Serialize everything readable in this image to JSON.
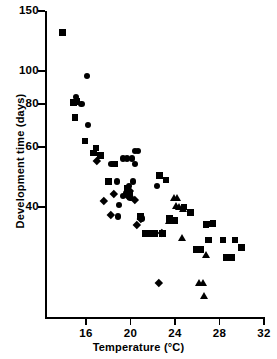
{
  "chart_data": {
    "type": "scatter",
    "title": "",
    "xlabel": "Temperature (°C)",
    "ylabel": "Development time (days)",
    "xlim": [
      13,
      32
    ],
    "ylim": [
      18,
      150
    ],
    "yscale": "log",
    "xscale": "linear",
    "grid": false,
    "legend": "none",
    "x_ticks": [
      16,
      20,
      24,
      28,
      32
    ],
    "x_tick_labels": [
      "16",
      "20",
      "24",
      "28",
      "32"
    ],
    "y_ticks": [
      150,
      100,
      80,
      60,
      40
    ],
    "y_tick_labels": [
      "150",
      "100",
      "80",
      "60",
      "40"
    ],
    "series": [
      {
        "name": "square",
        "marker": "square",
        "points": [
          [
            13.9,
            130
          ],
          [
            14.9,
            81
          ],
          [
            15.2,
            81.5
          ],
          [
            15.0,
            73
          ],
          [
            15.9,
            62.5
          ],
          [
            16.7,
            57.5
          ],
          [
            16.9,
            59.5
          ],
          [
            17.3,
            56.5
          ],
          [
            18.0,
            47.5
          ],
          [
            18.6,
            53.5
          ],
          [
            19.7,
            45.5
          ],
          [
            19.9,
            44.0
          ],
          [
            20.9,
            37.5
          ],
          [
            21.3,
            33.5
          ],
          [
            21.6,
            33.5
          ],
          [
            21.9,
            33.5
          ],
          [
            22.2,
            33.5
          ],
          [
            22.6,
            49.5
          ],
          [
            23.2,
            48.0
          ],
          [
            23.5,
            37.0
          ],
          [
            24.0,
            36.5
          ],
          [
            25.4,
            38.5
          ],
          [
            25.9,
            30.0
          ],
          [
            26.3,
            30.0
          ],
          [
            26.8,
            35.5
          ],
          [
            27.2,
            35.7
          ],
          [
            27.4,
            35.8
          ],
          [
            27.0,
            32.0
          ],
          [
            28.3,
            32.0
          ],
          [
            28.6,
            28.5
          ],
          [
            29.1,
            28.5
          ],
          [
            29.4,
            32.0
          ],
          [
            30.0,
            30.5
          ],
          [
            24.8,
            40.0
          ],
          [
            22.9,
            33.5
          ]
        ]
      },
      {
        "name": "circle",
        "marker": "circle",
        "points": [
          [
            16.1,
            97
          ],
          [
            15.1,
            84
          ],
          [
            15.6,
            80
          ],
          [
            16.2,
            69.5
          ],
          [
            18.3,
            53.5
          ],
          [
            19.3,
            55.5
          ],
          [
            19.7,
            55.5
          ],
          [
            20.1,
            55.5
          ],
          [
            20.4,
            58.5
          ],
          [
            20.7,
            58.5
          ],
          [
            20.4,
            53.5
          ],
          [
            18.8,
            47.5
          ],
          [
            19.9,
            46.0
          ],
          [
            20.2,
            47.5
          ],
          [
            19.6,
            44.0
          ],
          [
            19.3,
            43.0
          ],
          [
            19.0,
            40.5
          ],
          [
            18.9,
            37.5
          ],
          [
            22.4,
            46.0
          ],
          [
            21.0,
            37.0
          ],
          [
            20.0,
            42.5
          ]
        ]
      },
      {
        "name": "diamond",
        "marker": "diamond",
        "points": [
          [
            17.0,
            54.5
          ],
          [
            17.6,
            41.8
          ],
          [
            18.5,
            43.8
          ],
          [
            18.2,
            38.0
          ],
          [
            19.8,
            43.0
          ],
          [
            20.4,
            42.0
          ],
          [
            20.6,
            35.5
          ],
          [
            20.9,
            37.0
          ],
          [
            22.8,
            33.5
          ],
          [
            22.5,
            24.0
          ],
          [
            19.9,
            44.5
          ]
        ]
      },
      {
        "name": "triangle",
        "marker": "triangle",
        "points": [
          [
            23.9,
            42.5
          ],
          [
            24.2,
            42.5
          ],
          [
            24.1,
            40.5
          ],
          [
            24.4,
            40.0
          ],
          [
            24.7,
            39.5
          ],
          [
            23.5,
            36.5
          ],
          [
            24.6,
            32.5
          ],
          [
            26.8,
            29.0
          ],
          [
            26.2,
            24.0
          ],
          [
            26.5,
            24.0
          ],
          [
            26.6,
            22.0
          ]
        ]
      }
    ]
  },
  "axes": {
    "x_title": "Temperature (°C)",
    "y_title": "Development time (days)"
  },
  "colors": {
    "marker": "#000000",
    "axis": "#000000",
    "background": "#ffffff"
  }
}
